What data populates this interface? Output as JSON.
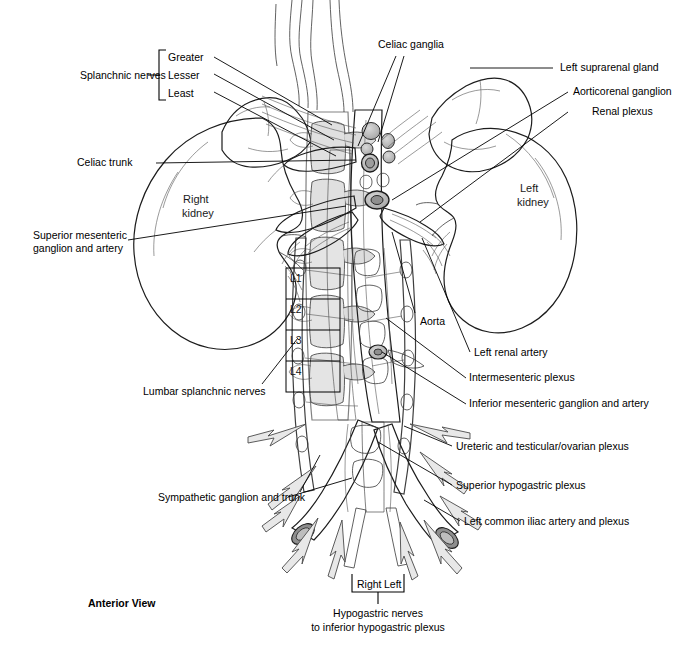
{
  "figure": {
    "view_caption": "Anterior View",
    "background_color": "#ffffff",
    "ink_color": "#000000"
  },
  "bracket_groups": [
    {
      "name": "splanchnic-nerves",
      "label": "Splanchnic nerves",
      "items": [
        "Greater",
        "Lesser",
        "Least"
      ]
    },
    {
      "name": "hypogastric-nerves",
      "label_line1": "Hypogastric nerves",
      "label_line2": "to inferior hypogastric plexus",
      "items": [
        "Right",
        "Left"
      ]
    }
  ],
  "vertebrae": {
    "name": "lumbar-vertebrae-box",
    "levels": [
      "L1",
      "L2",
      "L3",
      "L4"
    ]
  },
  "organ_labels": [
    {
      "name": "right-kidney",
      "line1": "Right",
      "line2": "kidney"
    },
    {
      "name": "left-kidney",
      "line1": "Left",
      "line2": "kidney"
    }
  ],
  "labels_left": [
    {
      "name": "celiac-trunk",
      "text": "Celiac trunk"
    },
    {
      "name": "superior-mesenteric-ganglion-and-artery",
      "line1": "Superior mesenteric",
      "line2": "ganglion and artery"
    },
    {
      "name": "lumbar-splanchnic-nerves",
      "text": "Lumbar splanchnic nerves"
    },
    {
      "name": "sympathetic-ganglion-and-trunk",
      "text": "Sympathetic ganglion and trunk"
    }
  ],
  "labels_right": [
    {
      "name": "celiac-ganglia",
      "text": "Celiac ganglia"
    },
    {
      "name": "left-suprarenal-gland",
      "text": "Left suprarenal gland"
    },
    {
      "name": "aorticorenal-ganglion",
      "text": "Aorticorenal ganglion"
    },
    {
      "name": "renal-plexus",
      "text": "Renal plexus"
    },
    {
      "name": "aorta",
      "text": "Aorta"
    },
    {
      "name": "left-renal-artery",
      "text": "Left renal artery"
    },
    {
      "name": "intermesenteric-plexus",
      "text": "Intermesenteric plexus"
    },
    {
      "name": "inferior-mesenteric-ganglion-and-artery",
      "text": "Inferior mesenteric ganglion and artery"
    },
    {
      "name": "ureteric-and-testicular-ovarian-plexus",
      "text": "Ureteric and testicular/ovarian plexus"
    },
    {
      "name": "superior-hypogastric-plexus",
      "text": "Superior hypogastric plexus"
    },
    {
      "name": "left-common-iliac-artery-and-plexus",
      "text": "Left common iliac artery and plexus"
    }
  ]
}
